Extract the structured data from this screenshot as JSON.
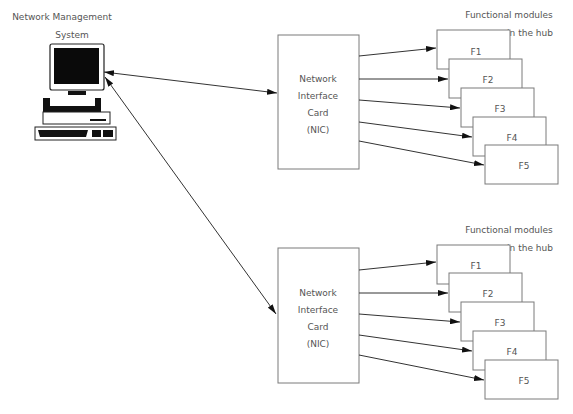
{
  "nms": {
    "title_line1": "Network Management",
    "title_line2": "System",
    "icon": "computer-workstation-icon"
  },
  "groups": [
    {
      "nic": {
        "line1": "Network",
        "line2": "Interface",
        "line3": "Card",
        "line4": "(NIC)"
      },
      "modules_label_line1": "Functional modules",
      "modules_label_line2": "in the hub",
      "modules": [
        "F1",
        "F2",
        "F3",
        "F4",
        "F5"
      ]
    },
    {
      "nic": {
        "line1": "Network",
        "line2": "Interface",
        "line3": "Card",
        "line4": "(NIC)"
      },
      "modules_label_line1": "Functional modules",
      "modules_label_line2": "in the hub",
      "modules": [
        "F1",
        "F2",
        "F3",
        "F4",
        "F5"
      ]
    }
  ],
  "colors": {
    "line": "#333333",
    "box_stroke": "#7a7a7a",
    "text": "#555555",
    "background": "#ffffff"
  }
}
